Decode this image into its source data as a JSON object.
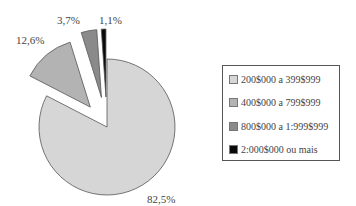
{
  "chart_data": {
    "type": "pie",
    "title": "",
    "categories": [
      "200$000 a 399$999",
      "400$000 a 799$999",
      "800$000 a 1:999$999",
      "2:000$000 ou mais"
    ],
    "values": [
      82.5,
      12.6,
      3.7,
      1.1
    ],
    "value_labels": [
      "82,5%",
      "12,6%",
      "3,7%",
      "1,1%"
    ],
    "colors": [
      "#d6d6d6",
      "#b3b3b3",
      "#8a8a8a",
      "#0a0a0a"
    ],
    "exploded": [
      false,
      true,
      true,
      true
    ],
    "legend_position": "right"
  },
  "labels": {
    "s0": "82,5%",
    "s1": "12,6%",
    "s2": "3,7%",
    "s3": "1,1%"
  },
  "legend": {
    "items": [
      {
        "label": "200$000 a 399$999",
        "color": "#d6d6d6"
      },
      {
        "label": "400$000 a 799$999",
        "color": "#b3b3b3"
      },
      {
        "label": "800$000 a 1:999$999",
        "color": "#8a8a8a"
      },
      {
        "label": "2:000$000 ou mais",
        "color": "#0a0a0a"
      }
    ]
  }
}
